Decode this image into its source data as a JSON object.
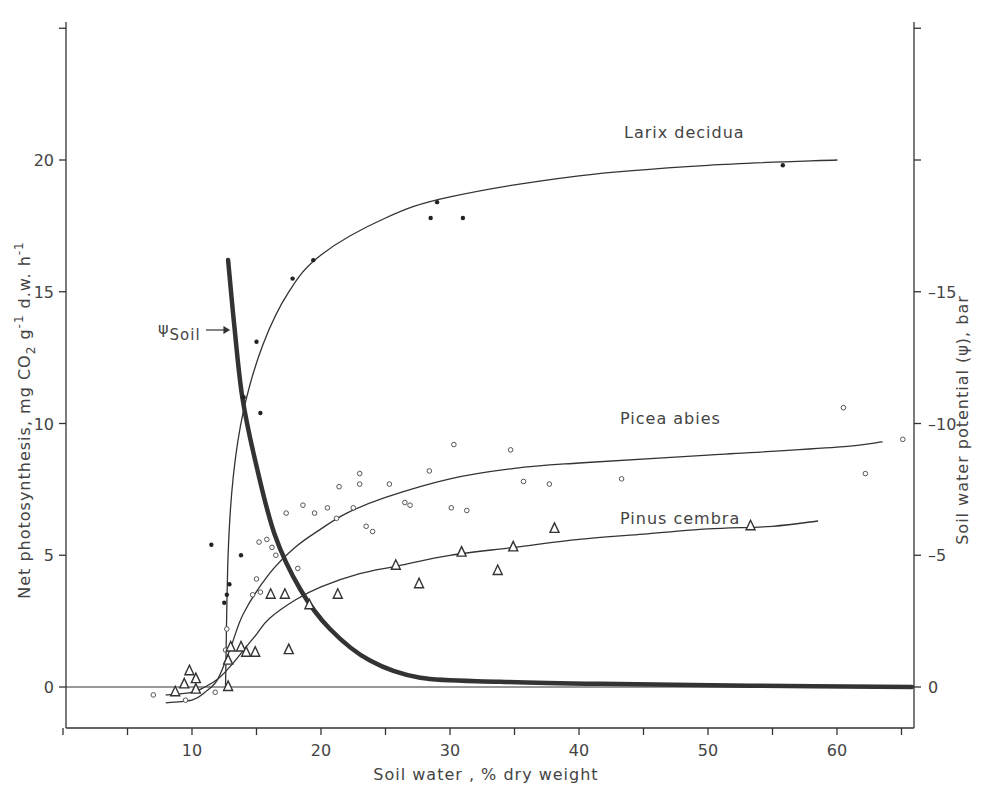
{
  "chart_data": {
    "type": "scatter",
    "title": "",
    "xlabel": "Soil water , % dry weight",
    "ylabel": "Net photosynthesis, mg CO2 g-1 d.w. h-1",
    "ylabel_parts": {
      "main": "Net photosynthesis, mg CO",
      "sub2": "2",
      "g": " g",
      "sup1": "-1",
      "dw": " d.w. h",
      "sup2": "-1"
    },
    "y2label": "Soil water potential (ψ), bar",
    "xlim": [
      0,
      66
    ],
    "ylim": [
      -1.6,
      25
    ],
    "y2lim": [
      1.6,
      -25
    ],
    "x_ticks": [
      0,
      5,
      10,
      15,
      20,
      25,
      30,
      35,
      40,
      45,
      50,
      55,
      60,
      65
    ],
    "x_tick_labels": [
      {
        "v": 10,
        "t": "10"
      },
      {
        "v": 20,
        "t": "20"
      },
      {
        "v": 30,
        "t": "30"
      },
      {
        "v": 40,
        "t": "40"
      },
      {
        "v": 50,
        "t": "50"
      },
      {
        "v": 60,
        "t": "60"
      }
    ],
    "y_ticks": [
      0,
      5,
      10,
      15,
      20,
      25
    ],
    "y_tick_labels": [
      {
        "v": 0,
        "t": "0"
      },
      {
        "v": 5,
        "t": "5"
      },
      {
        "v": 10,
        "t": "10"
      },
      {
        "v": 15,
        "t": "15"
      },
      {
        "v": 20,
        "t": "20"
      }
    ],
    "y2_ticks": [
      0,
      -5,
      -10,
      -15,
      -20,
      -25
    ],
    "y2_tick_labels": [
      {
        "v": 0,
        "t": "0"
      },
      {
        "v": -5,
        "t": "-5"
      },
      {
        "v": -10,
        "t": "-10"
      },
      {
        "v": -15,
        "t": "-15"
      }
    ],
    "grid": false,
    "zero_line": true,
    "series": [
      {
        "name": "Larix decidua",
        "marker": "dot",
        "label_pos": {
          "x": 43.5,
          "y": 20.8
        },
        "points": [
          [
            11.5,
            5.4
          ],
          [
            12.5,
            3.2
          ],
          [
            12.7,
            3.5
          ],
          [
            12.9,
            3.9
          ],
          [
            13.8,
            5.0
          ],
          [
            14.0,
            11.0
          ],
          [
            15.0,
            13.1
          ],
          [
            15.3,
            10.4
          ],
          [
            17.8,
            15.5
          ],
          [
            19.4,
            16.2
          ],
          [
            28.5,
            17.8
          ],
          [
            29.0,
            18.4
          ],
          [
            31.0,
            17.8
          ],
          [
            55.8,
            19.8
          ]
        ],
        "curve": [
          [
            12.6,
            0.0
          ],
          [
            12.8,
            5.0
          ],
          [
            13.2,
            8.0
          ],
          [
            14.0,
            10.5
          ],
          [
            15.5,
            13.0
          ],
          [
            17.5,
            15.0
          ],
          [
            20,
            16.4
          ],
          [
            25,
            17.8
          ],
          [
            30,
            18.6
          ],
          [
            40,
            19.4
          ],
          [
            50,
            19.8
          ],
          [
            60,
            20.0
          ]
        ]
      },
      {
        "name": "Picea abies",
        "marker": "circle",
        "label_pos": {
          "x": 43.2,
          "y": 10.2
        },
        "points": [
          [
            7.0,
            -0.3
          ],
          [
            9.5,
            -0.5
          ],
          [
            11.8,
            -0.2
          ],
          [
            12.7,
            2.2
          ],
          [
            12.6,
            1.4
          ],
          [
            14.7,
            3.5
          ],
          [
            15.3,
            3.6
          ],
          [
            15.0,
            4.1
          ],
          [
            15.2,
            5.5
          ],
          [
            15.8,
            5.6
          ],
          [
            16.2,
            5.3
          ],
          [
            16.5,
            5.0
          ],
          [
            17.3,
            6.6
          ],
          [
            18.2,
            4.5
          ],
          [
            18.6,
            6.9
          ],
          [
            19.5,
            6.6
          ],
          [
            20.5,
            6.8
          ],
          [
            21.2,
            6.4
          ],
          [
            21.4,
            7.6
          ],
          [
            22.5,
            6.8
          ],
          [
            23.0,
            8.1
          ],
          [
            23.0,
            7.7
          ],
          [
            23.5,
            6.1
          ],
          [
            24.0,
            5.9
          ],
          [
            25.3,
            7.7
          ],
          [
            26.5,
            7.0
          ],
          [
            26.9,
            6.9
          ],
          [
            28.4,
            8.2
          ],
          [
            30.3,
            9.2
          ],
          [
            30.1,
            6.8
          ],
          [
            31.3,
            6.7
          ],
          [
            34.7,
            9.0
          ],
          [
            35.7,
            7.8
          ],
          [
            37.7,
            7.7
          ],
          [
            43.3,
            7.9
          ],
          [
            60.5,
            10.6
          ],
          [
            62.2,
            8.1
          ],
          [
            65.1,
            9.4
          ]
        ],
        "curve": [
          [
            8.0,
            -0.6
          ],
          [
            10,
            -0.5
          ],
          [
            11,
            -0.2
          ],
          [
            12,
            0.3
          ],
          [
            13,
            1.5
          ],
          [
            14,
            2.8
          ],
          [
            16,
            4.3
          ],
          [
            18,
            5.3
          ],
          [
            20,
            6.0
          ],
          [
            22,
            6.6
          ],
          [
            25,
            7.2
          ],
          [
            30,
            7.9
          ],
          [
            35,
            8.3
          ],
          [
            40,
            8.5
          ],
          [
            50,
            8.8
          ],
          [
            60,
            9.1
          ],
          [
            63.5,
            9.3
          ]
        ]
      },
      {
        "name": "Pinus cembra",
        "marker": "triangle",
        "label_pos": {
          "x": 43.2,
          "y": 6.4
        },
        "points": [
          [
            8.7,
            -0.2
          ],
          [
            9.4,
            0.1
          ],
          [
            9.8,
            0.6
          ],
          [
            10.3,
            -0.1
          ],
          [
            10.3,
            0.3
          ],
          [
            12.8,
            0.0
          ],
          [
            12.8,
            1.0
          ],
          [
            13.0,
            1.5
          ],
          [
            13.8,
            1.5
          ],
          [
            14.2,
            1.3
          ],
          [
            14.9,
            1.3
          ],
          [
            16.1,
            3.5
          ],
          [
            17.2,
            3.5
          ],
          [
            17.5,
            1.4
          ],
          [
            19.1,
            3.1
          ],
          [
            21.3,
            3.5
          ],
          [
            25.8,
            4.6
          ],
          [
            27.6,
            3.9
          ],
          [
            30.9,
            5.1
          ],
          [
            33.7,
            4.4
          ],
          [
            34.9,
            5.3
          ],
          [
            38.1,
            6.0
          ],
          [
            53.3,
            6.1
          ]
        ],
        "curve": [
          [
            8.0,
            -0.3
          ],
          [
            10,
            -0.2
          ],
          [
            11,
            0.0
          ],
          [
            12,
            0.3
          ],
          [
            13,
            0.8
          ],
          [
            14,
            1.4
          ],
          [
            15,
            2.0
          ],
          [
            16,
            2.6
          ],
          [
            18,
            3.3
          ],
          [
            20,
            3.8
          ],
          [
            23,
            4.3
          ],
          [
            26,
            4.6
          ],
          [
            30,
            5.0
          ],
          [
            35,
            5.3
          ],
          [
            40,
            5.6
          ],
          [
            45,
            5.8
          ],
          [
            50,
            6.0
          ],
          [
            55,
            6.1
          ],
          [
            58.5,
            6.3
          ]
        ]
      },
      {
        "name": "ψSoil",
        "axis": "right",
        "marker": "none",
        "line_weight": "bold",
        "label": "ψ",
        "label_sub": "Soil",
        "curve": [
          [
            12.8,
            -16.2
          ],
          [
            13.3,
            -13.6
          ],
          [
            13.9,
            -11.0
          ],
          [
            14.9,
            -8.6
          ],
          [
            16.4,
            -5.8
          ],
          [
            18.4,
            -3.7
          ],
          [
            20.7,
            -2.2
          ],
          [
            23.8,
            -1.0
          ],
          [
            27.7,
            -0.35
          ],
          [
            33.9,
            -0.2
          ],
          [
            41.6,
            -0.12
          ],
          [
            53.3,
            -0.05
          ],
          [
            65.8,
            0.0
          ]
        ]
      }
    ]
  }
}
